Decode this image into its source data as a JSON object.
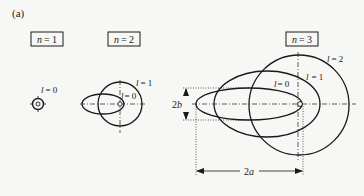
{
  "figure": {
    "panel_label": "(a)",
    "colors": {
      "ink": "#1a1a1a",
      "background": "#f7f7f5"
    }
  },
  "groups": [
    {
      "id": "n1",
      "label_var": "n",
      "label_eq": "= 1",
      "orbits": [
        {
          "l_var": "l",
          "l_eq": "= 0"
        }
      ]
    },
    {
      "id": "n2",
      "label_var": "n",
      "label_eq": "= 2",
      "orbits": [
        {
          "l_var": "l",
          "l_eq": "= 0"
        },
        {
          "l_var": "l",
          "l_eq": "= 1"
        }
      ]
    },
    {
      "id": "n3",
      "label_var": "n",
      "label_eq": "= 3",
      "orbits": [
        {
          "l_var": "l",
          "l_eq": "= 0"
        },
        {
          "l_var": "l",
          "l_eq": "= 1"
        },
        {
          "l_var": "l",
          "l_eq": "= 2"
        }
      ]
    }
  ],
  "dimensions": {
    "minor_axis": {
      "coef": "2",
      "var": "b"
    },
    "major_axis": {
      "coef": "2",
      "var": "a"
    }
  }
}
